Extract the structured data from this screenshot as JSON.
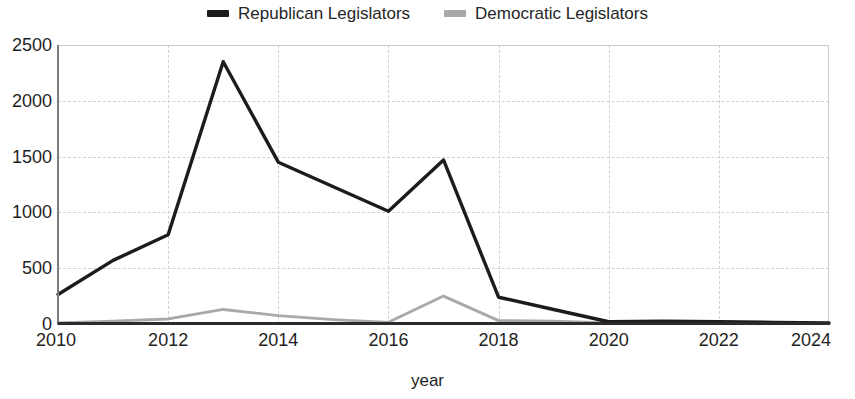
{
  "legend": {
    "position": "top-center",
    "entries": [
      {
        "label": "Republican Legislators",
        "color": "#1c1c1c",
        "swatch": "legend-swatch-republican"
      },
      {
        "label": "Democratic Legislators",
        "color": "#a9a9a9",
        "swatch": "legend-swatch-democratic"
      }
    ]
  },
  "axes": {
    "xlabel": "year",
    "ylabel": "",
    "yticks": [
      "0",
      "500",
      "1000",
      "1500",
      "2000",
      "2500"
    ],
    "xticks": [
      "2010",
      "2012",
      "2014",
      "2016",
      "2018",
      "2020",
      "2022",
      "2024"
    ]
  },
  "chart_data": {
    "type": "line",
    "title": "",
    "subtitle": "",
    "xlabel": "year",
    "ylabel": "",
    "xlim": [
      2010,
      2024
    ],
    "ylim": [
      0,
      2500
    ],
    "xticks": [
      2010,
      2012,
      2014,
      2016,
      2018,
      2020,
      2022,
      2024
    ],
    "yticks": [
      0,
      500,
      1000,
      1500,
      2000,
      2500
    ],
    "grid": true,
    "legend_position": "top-center",
    "x": [
      2010,
      2011,
      2012,
      2013,
      2014,
      2015,
      2016,
      2017,
      2018,
      2019,
      2020,
      2021,
      2022,
      2023,
      2024
    ],
    "series": [
      {
        "name": "Republican Legislators",
        "color": "#1c1c1c",
        "values": [
          265,
          570,
          800,
          2350,
          1450,
          1230,
          1010,
          1470,
          240,
          130,
          20,
          25,
          20,
          15,
          10
        ]
      },
      {
        "name": "Democratic Legislators",
        "color": "#a9a9a9",
        "values": [
          10,
          25,
          45,
          130,
          75,
          40,
          15,
          250,
          30,
          25,
          10,
          10,
          10,
          8,
          5
        ]
      }
    ]
  }
}
